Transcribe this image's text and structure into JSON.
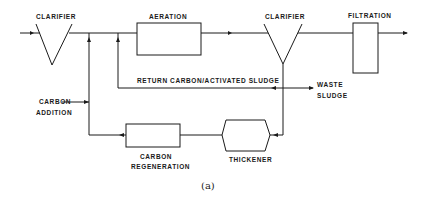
{
  "diagram": {
    "caption": "(a)",
    "units": {
      "clarifier_1": {
        "label": "CLARIFIER"
      },
      "aeration": {
        "label": "AERATION"
      },
      "clarifier_2": {
        "label": "CLARIFIER"
      },
      "filtration": {
        "label": "FILTRATION"
      },
      "thickener": {
        "label": "THICKENER"
      },
      "carbon_regeneration": {
        "label_line1": "CARBON",
        "label_line2": "REGENERATION"
      }
    },
    "streams": {
      "return_sludge": {
        "label": "RETURN  CARBON/ACTIVATED SLUDGE"
      },
      "waste_sludge": {
        "label_line1": "WASTE",
        "label_line2": "SLUDGE"
      },
      "carbon_addition": {
        "label_line1": "CARBON",
        "label_line2": "ADDITION"
      }
    },
    "colors": {
      "line": "#1a1a1a",
      "background": "#ffffff"
    }
  }
}
